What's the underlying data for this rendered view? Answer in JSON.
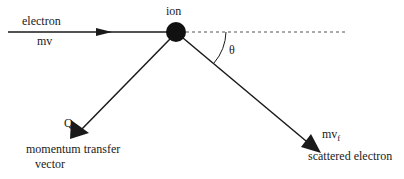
{
  "diagram": {
    "labels": {
      "incoming_line1": "electron",
      "incoming_line2": "mv",
      "ion": "ion",
      "angle": "θ",
      "q": "Q",
      "transfer_line1": "momentum transfer",
      "transfer_line2": "vector",
      "outgoing_main": "mv",
      "outgoing_sub": "f",
      "outgoing_desc": "scattered electron"
    },
    "colors": {
      "stroke": "#1a1a1a",
      "dashed": "#555555",
      "ion": "#111111"
    }
  }
}
